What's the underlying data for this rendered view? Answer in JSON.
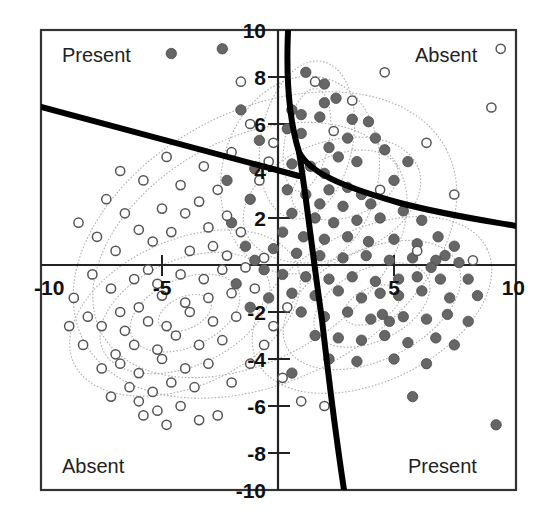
{
  "figure": {
    "background": "#ffffff",
    "frame_color": "#333333",
    "axis_color": "#222222",
    "boundary_color": "#000000",
    "contour_color": "#aaaaaa",
    "present_marker_color": "#666666",
    "absent_marker_color": "#ffffff",
    "absent_marker_stroke": "#555555"
  },
  "quadrant_labels": [
    {
      "name": "top-left",
      "text": "Present",
      "x": 62,
      "y": 62
    },
    {
      "name": "top-right",
      "text": "Absent",
      "x": 415,
      "y": 62
    },
    {
      "name": "bottom-left",
      "text": "Absent",
      "x": 62,
      "y": 473
    },
    {
      "name": "bottom-right",
      "text": "Present",
      "x": 408,
      "y": 473
    }
  ],
  "chart_data": {
    "type": "scatter",
    "title": "",
    "xlabel": "",
    "ylabel": "",
    "xlim": [
      -10.2,
      10.2
    ],
    "ylim": [
      -10.2,
      10.2
    ],
    "grid": false,
    "legend": "none",
    "annotations": [
      "Present",
      "Absent",
      "Absent",
      "Present"
    ],
    "xticks": [
      -10,
      -5,
      5,
      10
    ],
    "xtick_labels": [
      "-10",
      "-5",
      "5",
      "10"
    ],
    "yticks": [
      -10,
      -8,
      -6,
      -4,
      -2,
      2,
      4,
      6,
      8,
      10
    ],
    "ytick_labels": [
      "-10",
      "-8",
      "-6",
      "-4",
      "-2",
      "2",
      "4",
      "6",
      "8",
      "10"
    ],
    "series": [
      {
        "name": "Present (filled)",
        "marker": "filled-circle",
        "color": "#666666",
        "radius": 5.2,
        "points": [
          [
            -4.6,
            9.0
          ],
          [
            -1.6,
            6.6
          ],
          [
            -2.4,
            9.2
          ],
          [
            1.2,
            8.2
          ],
          [
            2.0,
            7.7
          ],
          [
            2.5,
            7.1
          ],
          [
            0.6,
            6.6
          ],
          [
            1.0,
            6.4
          ],
          [
            1.8,
            6.3
          ],
          [
            0.4,
            5.8
          ],
          [
            1.0,
            5.6
          ],
          [
            -0.8,
            5.3
          ],
          [
            3.2,
            6.2
          ],
          [
            3.9,
            6.1
          ],
          [
            4.2,
            5.4
          ],
          [
            2.2,
            5.0
          ],
          [
            -1.0,
            4.1
          ],
          [
            0.6,
            4.3
          ],
          [
            1.4,
            4.2
          ],
          [
            2.0,
            3.9
          ],
          [
            2.6,
            4.6
          ],
          [
            3.4,
            4.4
          ],
          [
            4.6,
            4.9
          ],
          [
            5.6,
            4.4
          ],
          [
            2.2,
            3.2
          ],
          [
            3.0,
            3.3
          ],
          [
            3.6,
            3.0
          ],
          [
            1.2,
            3.0
          ],
          [
            0.4,
            3.2
          ],
          [
            1.8,
            2.6
          ],
          [
            2.8,
            2.5
          ],
          [
            4.0,
            2.6
          ],
          [
            0.6,
            2.2
          ],
          [
            1.6,
            2.0
          ],
          [
            2.4,
            1.8
          ],
          [
            3.4,
            1.9
          ],
          [
            4.4,
            2.0
          ],
          [
            5.4,
            2.3
          ],
          [
            6.2,
            1.9
          ],
          [
            0.2,
            1.4
          ],
          [
            1.1,
            1.2
          ],
          [
            2.0,
            1.1
          ],
          [
            3.0,
            1.2
          ],
          [
            3.9,
            1.0
          ],
          [
            5.0,
            1.1
          ],
          [
            6.0,
            0.9
          ],
          [
            6.9,
            1.2
          ],
          [
            7.6,
            0.8
          ],
          [
            -0.2,
            0.7
          ],
          [
            0.8,
            0.5
          ],
          [
            1.8,
            0.4
          ],
          [
            2.8,
            0.3
          ],
          [
            3.8,
            0.4
          ],
          [
            4.8,
            0.2
          ],
          [
            5.8,
            0.3
          ],
          [
            6.8,
            0.2
          ],
          [
            7.8,
            0.1
          ],
          [
            -1.0,
            0.2
          ],
          [
            0.2,
            -0.4
          ],
          [
            1.2,
            -0.5
          ],
          [
            2.2,
            -0.6
          ],
          [
            3.2,
            -0.5
          ],
          [
            4.2,
            -0.7
          ],
          [
            5.2,
            -0.6
          ],
          [
            6.0,
            -0.5
          ],
          [
            7.0,
            -0.6
          ],
          [
            8.2,
            -0.6
          ],
          [
            0.6,
            -1.2
          ],
          [
            1.6,
            -1.3
          ],
          [
            2.6,
            -1.1
          ],
          [
            3.6,
            -1.4
          ],
          [
            4.4,
            -1.2
          ],
          [
            5.2,
            -1.3
          ],
          [
            6.2,
            -1.1
          ],
          [
            7.4,
            -1.4
          ],
          [
            8.6,
            -1.3
          ],
          [
            1.0,
            -2.0
          ],
          [
            2.0,
            -2.2
          ],
          [
            3.0,
            -2.0
          ],
          [
            4.0,
            -2.3
          ],
          [
            4.5,
            -2.1
          ],
          [
            4.8,
            -2.4
          ],
          [
            5.4,
            -2.2
          ],
          [
            6.4,
            -2.3
          ],
          [
            7.3,
            -2.1
          ],
          [
            8.2,
            -2.4
          ],
          [
            1.6,
            -3.0
          ],
          [
            2.6,
            -3.1
          ],
          [
            3.6,
            -3.2
          ],
          [
            4.6,
            -3.0
          ],
          [
            5.6,
            -3.3
          ],
          [
            6.8,
            -3.1
          ],
          [
            7.6,
            -3.4
          ],
          [
            2.2,
            -4.0
          ],
          [
            3.4,
            -4.1
          ],
          [
            5.0,
            -4.0
          ],
          [
            6.4,
            -4.2
          ],
          [
            0.6,
            -4.6
          ],
          [
            5.8,
            -5.6
          ],
          [
            9.4,
            -6.8
          ],
          [
            6.6,
            -0.1
          ],
          [
            7.2,
            0.4
          ],
          [
            -2.2,
            3.6
          ],
          [
            -1.2,
            2.8
          ],
          [
            -2.0,
            1.8
          ],
          [
            -1.4,
            0.8
          ],
          [
            -0.6,
            -0.2
          ],
          [
            -1.8,
            -0.8
          ],
          [
            -0.4,
            -1.4
          ],
          [
            -1.2,
            -1.8
          ],
          [
            5.0,
            3.6
          ],
          [
            3.0,
            5.4
          ],
          [
            2.0,
            6.9
          ]
        ]
      },
      {
        "name": "Absent (open)",
        "marker": "open-circle",
        "color": "#ffffff",
        "stroke": "#555555",
        "radius": 4.6,
        "points": [
          [
            -1.6,
            7.8
          ],
          [
            1.6,
            7.8
          ],
          [
            4.6,
            8.2
          ],
          [
            9.6,
            9.2
          ],
          [
            3.2,
            7.0
          ],
          [
            9.2,
            6.7
          ],
          [
            2.4,
            5.7
          ],
          [
            6.4,
            5.2
          ],
          [
            -0.4,
            4.4
          ],
          [
            4.4,
            3.2
          ],
          [
            7.6,
            3.0
          ],
          [
            -0.8,
            3.6
          ],
          [
            -2.6,
            3.2
          ],
          [
            -3.4,
            2.7
          ],
          [
            -4.0,
            2.2
          ],
          [
            -2.2,
            2.1
          ],
          [
            -3.0,
            1.6
          ],
          [
            -1.6,
            1.4
          ],
          [
            -2.8,
            0.8
          ],
          [
            -3.8,
            0.6
          ],
          [
            -4.6,
            1.4
          ],
          [
            -5.4,
            1.0
          ],
          [
            -6.0,
            1.5
          ],
          [
            -5.0,
            2.4
          ],
          [
            -6.6,
            2.2
          ],
          [
            -7.4,
            2.8
          ],
          [
            -4.2,
            3.4
          ],
          [
            -5.8,
            3.6
          ],
          [
            -6.8,
            4.0
          ],
          [
            -3.2,
            4.2
          ],
          [
            -2.0,
            4.8
          ],
          [
            -4.8,
            4.6
          ],
          [
            -7.0,
            0.6
          ],
          [
            -7.8,
            1.2
          ],
          [
            -8.6,
            1.8
          ],
          [
            -0.6,
            0.3
          ],
          [
            -1.4,
            -0.1
          ],
          [
            -2.4,
            -0.2
          ],
          [
            -3.2,
            -0.6
          ],
          [
            -4.2,
            -0.4
          ],
          [
            -5.2,
            -0.8
          ],
          [
            -6.2,
            -0.6
          ],
          [
            -7.2,
            -1.0
          ],
          [
            -8.0,
            -0.4
          ],
          [
            -1.0,
            -1.0
          ],
          [
            -2.0,
            -1.2
          ],
          [
            -3.0,
            -1.4
          ],
          [
            -4.0,
            -1.6
          ],
          [
            -5.0,
            -1.3
          ],
          [
            -6.0,
            -1.8
          ],
          [
            -6.8,
            -2.0
          ],
          [
            -1.8,
            -2.2
          ],
          [
            -2.8,
            -2.4
          ],
          [
            -3.8,
            -2.0
          ],
          [
            -4.8,
            -2.6
          ],
          [
            -5.6,
            -2.4
          ],
          [
            -6.6,
            -2.8
          ],
          [
            -7.6,
            -2.6
          ],
          [
            -8.2,
            -2.2
          ],
          [
            -2.4,
            -3.2
          ],
          [
            -3.4,
            -3.4
          ],
          [
            -4.4,
            -3.0
          ],
          [
            -5.2,
            -3.6
          ],
          [
            -6.2,
            -3.4
          ],
          [
            -7.0,
            -3.8
          ],
          [
            -3.0,
            -4.2
          ],
          [
            -4.0,
            -4.4
          ],
          [
            -5.0,
            -4.0
          ],
          [
            -6.0,
            -4.6
          ],
          [
            -6.8,
            -4.2
          ],
          [
            -7.6,
            -4.4
          ],
          [
            -3.6,
            -5.2
          ],
          [
            -4.6,
            -5.0
          ],
          [
            -5.4,
            -5.4
          ],
          [
            -6.4,
            -5.2
          ],
          [
            -7.2,
            -5.6
          ],
          [
            -4.2,
            -6.0
          ],
          [
            -5.2,
            -6.2
          ],
          [
            -6.0,
            -5.8
          ],
          [
            -2.6,
            -6.4
          ],
          [
            -3.4,
            -6.6
          ],
          [
            -8.4,
            -3.4
          ],
          [
            -9.0,
            -2.6
          ],
          [
            1.0,
            -5.8
          ],
          [
            0.2,
            -4.8
          ],
          [
            2.0,
            -6.0
          ],
          [
            6.0,
            0.6
          ],
          [
            8.4,
            0.2
          ],
          [
            -0.2,
            5.2
          ],
          [
            -1.2,
            6.0
          ],
          [
            -5.8,
            -6.4
          ],
          [
            -4.8,
            -6.8
          ],
          [
            -2.0,
            -5.0
          ],
          [
            -1.2,
            -4.2
          ],
          [
            -0.6,
            -3.4
          ],
          [
            -0.2,
            -2.6
          ],
          [
            0.4,
            -1.8
          ],
          [
            -8.8,
            -1.4
          ],
          [
            -5.6,
            -0.2
          ],
          [
            -2.2,
            0.4
          ]
        ]
      }
    ],
    "decision_boundaries": [
      {
        "name": "upper-left-line",
        "style": "thick-solid"
      },
      {
        "name": "right-curve",
        "style": "thick-solid"
      },
      {
        "name": "lower-line",
        "style": "thick-solid"
      }
    ],
    "density_contours": {
      "absent_group_center": [
        -4.0,
        -2.0
      ],
      "present_group_center": [
        4.0,
        0.0
      ],
      "top_group_center": [
        1.5,
        5.5
      ],
      "levels": 4,
      "style": "dotted"
    }
  }
}
